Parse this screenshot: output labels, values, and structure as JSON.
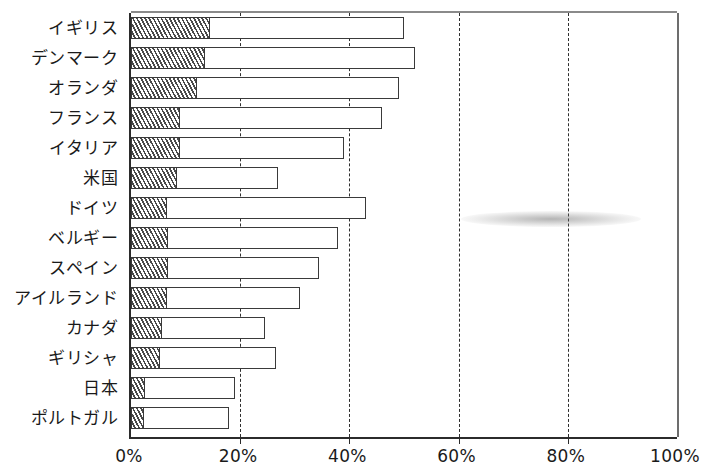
{
  "chart_data": {
    "type": "bar",
    "orientation": "horizontal",
    "stacked": true,
    "title": "",
    "xlabel": "",
    "ylabel": "",
    "xlim": [
      0,
      100
    ],
    "xticks": [
      0,
      20,
      40,
      60,
      80,
      100
    ],
    "xtick_labels": [
      "0%",
      "20%",
      "40%",
      "60%",
      "80%",
      "100%"
    ],
    "grid": "vertical-dashed",
    "legend": "none",
    "categories": [
      "イギリス",
      "デンマーク",
      "オランダ",
      "フランス",
      "イタリア",
      "米国",
      "ドイツ",
      "ベルギー",
      "スペイン",
      "アイルランド",
      "カナダ",
      "ギリシャ",
      "日本",
      "ポルトガル"
    ],
    "series": [
      {
        "name": "hatched-segment",
        "style": "diagonal-hatch",
        "values": [
          14.5,
          13.5,
          12.0,
          9.0,
          9.0,
          8.5,
          6.6,
          6.8,
          6.8,
          6.6,
          5.7,
          5.3,
          2.6,
          2.4
        ]
      },
      {
        "name": "total-bar",
        "style": "white-outline",
        "values": [
          50.0,
          52.0,
          49.0,
          46.0,
          39.0,
          27.0,
          43.0,
          38.0,
          34.5,
          31.0,
          24.5,
          26.5,
          19.0,
          18.0
        ]
      }
    ]
  },
  "colors": {
    "bar_outline": "#3a3a3a",
    "bar_fill": "#ffffff",
    "hatch_line": "#4a4a4a",
    "axis": "#2b2b2b",
    "gridline": "#2e2e2e",
    "text": "#1a1a1a",
    "background": "#ffffff"
  }
}
